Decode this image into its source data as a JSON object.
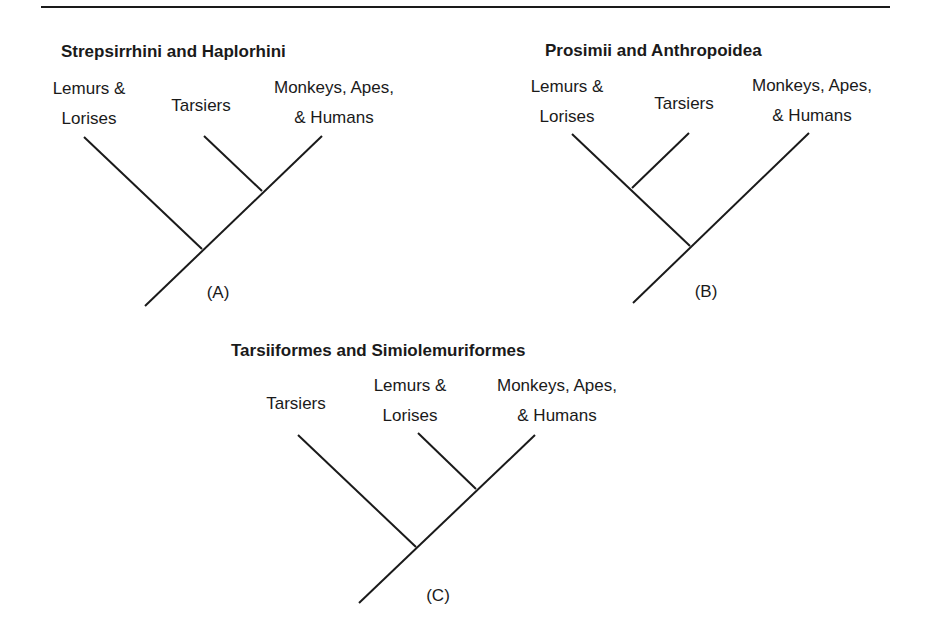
{
  "diagrams": [
    {
      "id": "A",
      "title": "Strepsirrhini and Haplorhini",
      "tag": "(A)",
      "taxa": [
        {
          "line1": "Lemurs &",
          "line2": "Lorises"
        },
        {
          "line1": "Tarsiers",
          "line2": ""
        },
        {
          "line1": "Monkeys, Apes,",
          "line2": "& Humans"
        }
      ]
    },
    {
      "id": "B",
      "title": "Prosimii and Anthropoidea",
      "tag": "(B)",
      "taxa": [
        {
          "line1": "Lemurs &",
          "line2": "Lorises"
        },
        {
          "line1": "Tarsiers",
          "line2": ""
        },
        {
          "line1": "Monkeys, Apes,",
          "line2": "& Humans"
        }
      ]
    },
    {
      "id": "C",
      "title": "Tarsiiformes and Simiolemuriformes",
      "tag": "(C)",
      "taxa": [
        {
          "line1": "Tarsiers",
          "line2": ""
        },
        {
          "line1": "Lemurs &",
          "line2": "Lorises"
        },
        {
          "line1": "Monkeys, Apes,",
          "line2": "& Humans"
        }
      ]
    }
  ],
  "colors": {
    "line": "#1a1a1a",
    "background": "#ffffff"
  }
}
